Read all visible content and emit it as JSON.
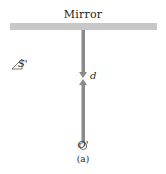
{
  "figure": {
    "mirror_label": "Mirror",
    "source_label": "S'",
    "separation_label": "d",
    "origin_label": "O'",
    "caption": "(a)"
  },
  "colors": {
    "mirror": "#c8c8c8",
    "rod": "#8a8a8a",
    "text": "#222222"
  }
}
